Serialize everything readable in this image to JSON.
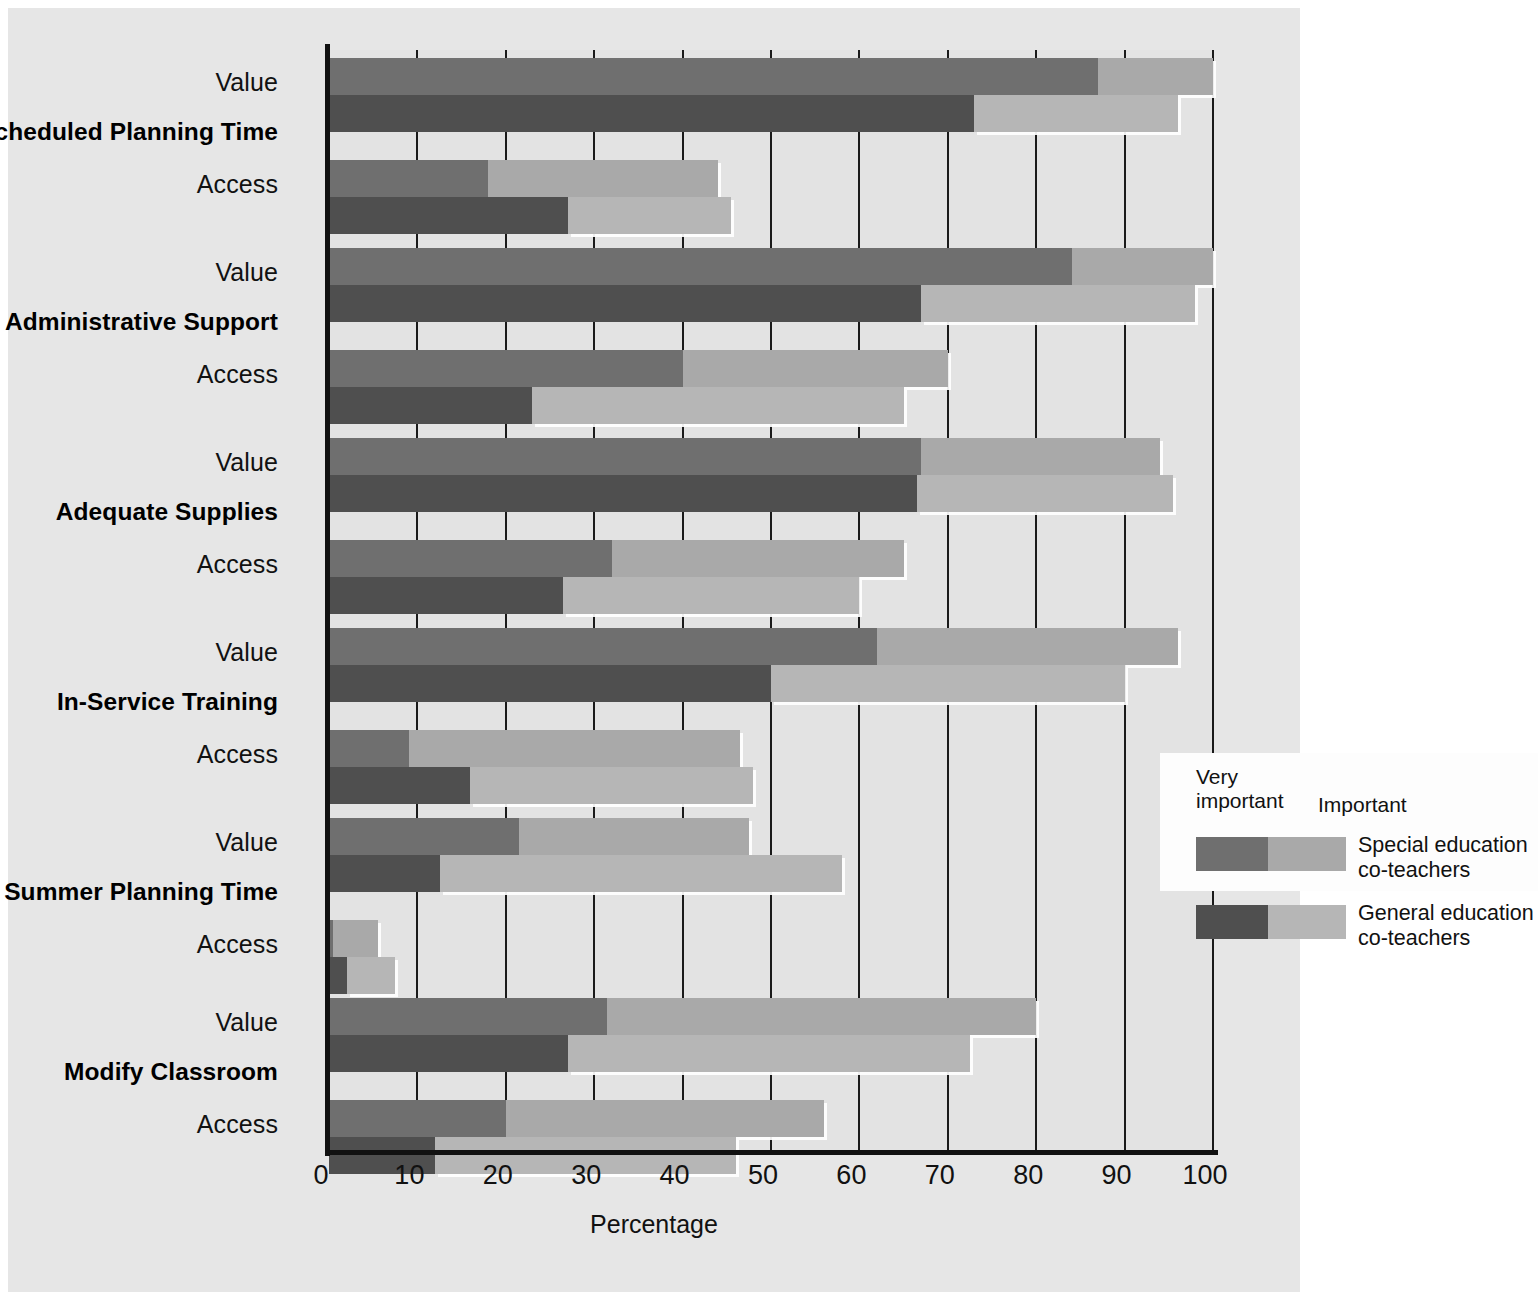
{
  "chart_data": {
    "type": "bar",
    "orientation": "horizontal",
    "stacked": true,
    "title": "",
    "xlabel": "Percentage",
    "ylabel": "",
    "xlim": [
      0,
      100
    ],
    "xticks": [
      0,
      10,
      20,
      30,
      40,
      50,
      60,
      70,
      80,
      90,
      100
    ],
    "grid": true,
    "legend_position": "center-right",
    "legend": {
      "header_very_important": "Very\nimportant",
      "header_very_important_line1": "Very",
      "header_very_important_line2": "important",
      "header_important": "Important",
      "entries": [
        {
          "name": "Special education co-teachers",
          "line1": "Special education",
          "line2": "co-teachers",
          "very_important_color": "#6f6f6f",
          "important_color": "#a9a9a9"
        },
        {
          "name": "General education co-teachers",
          "line1": "General education",
          "line2": "co-teachers",
          "very_important_color": "#4f4f4f",
          "important_color": "#b6b6b6"
        }
      ]
    },
    "segment_names": [
      "Very important",
      "Important"
    ],
    "series_names": [
      "Special education co-teachers",
      "General education co-teachers"
    ],
    "row_measures": [
      "Value",
      "Access"
    ],
    "categories": [
      "Scheduled Planning Time",
      "Administrative Support",
      "Adequate Supplies",
      "In-Service Training",
      "Summer Planning Time",
      "Modify Classroom"
    ],
    "groups": [
      {
        "category": "Scheduled Planning Time",
        "rows": [
          {
            "measure": "Value",
            "bars": [
              {
                "series": "Special education co-teachers",
                "very_important": 87,
                "important": 13,
                "total": 100
              },
              {
                "series": "General education co-teachers",
                "very_important": 73,
                "important": 23,
                "total": 96
              }
            ]
          },
          {
            "measure": "Access",
            "bars": [
              {
                "series": "Special education co-teachers",
                "very_important": 18,
                "important": 26,
                "total": 44
              },
              {
                "series": "General education co-teachers",
                "very_important": 27,
                "important": 18.5,
                "total": 45.5
              }
            ]
          }
        ]
      },
      {
        "category": "Administrative Support",
        "rows": [
          {
            "measure": "Value",
            "bars": [
              {
                "series": "Special education co-teachers",
                "very_important": 84,
                "important": 16,
                "total": 100
              },
              {
                "series": "General education co-teachers",
                "very_important": 67,
                "important": 31,
                "total": 98
              }
            ]
          },
          {
            "measure": "Access",
            "bars": [
              {
                "series": "Special education co-teachers",
                "very_important": 40,
                "important": 30,
                "total": 70
              },
              {
                "series": "General education co-teachers",
                "very_important": 23,
                "important": 42,
                "total": 65
              }
            ]
          }
        ]
      },
      {
        "category": "Adequate Supplies",
        "rows": [
          {
            "measure": "Value",
            "bars": [
              {
                "series": "Special education co-teachers",
                "very_important": 67,
                "important": 27,
                "total": 94
              },
              {
                "series": "General education co-teachers",
                "very_important": 66.5,
                "important": 29,
                "total": 95.5
              }
            ]
          },
          {
            "measure": "Access",
            "bars": [
              {
                "series": "Special education co-teachers",
                "very_important": 32,
                "important": 33,
                "total": 65
              },
              {
                "series": "General education co-teachers",
                "very_important": 26.5,
                "important": 33.5,
                "total": 60
              }
            ]
          }
        ]
      },
      {
        "category": "In-Service Training",
        "rows": [
          {
            "measure": "Value",
            "bars": [
              {
                "series": "Special education co-teachers",
                "very_important": 62,
                "important": 34,
                "total": 96
              },
              {
                "series": "General education co-teachers",
                "very_important": 50,
                "important": 40,
                "total": 90
              }
            ]
          },
          {
            "measure": "Access",
            "bars": [
              {
                "series": "Special education co-teachers",
                "very_important": 9,
                "important": 37.5,
                "total": 46.5
              },
              {
                "series": "General education co-teachers",
                "very_important": 16,
                "important": 32,
                "total": 48
              }
            ]
          }
        ]
      },
      {
        "category": "Summer Planning Time",
        "rows": [
          {
            "measure": "Value",
            "bars": [
              {
                "series": "Special education co-teachers",
                "very_important": 21.5,
                "important": 26,
                "total": 47.5
              },
              {
                "series": "General education co-teachers",
                "very_important": 12.5,
                "important": 45.5,
                "total": 58
              }
            ]
          },
          {
            "measure": "Access",
            "bars": [
              {
                "series": "Special education co-teachers",
                "very_important": 0.5,
                "important": 5,
                "total": 5.5
              },
              {
                "series": "General education co-teachers",
                "very_important": 2,
                "important": 5.5,
                "total": 7.5
              }
            ]
          }
        ]
      },
      {
        "category": "Modify Classroom",
        "rows": [
          {
            "measure": "Value",
            "bars": [
              {
                "series": "Special education co-teachers",
                "very_important": 31.5,
                "important": 48.5,
                "total": 80
              },
              {
                "series": "General education co-teachers",
                "very_important": 27,
                "important": 45.5,
                "total": 72.5
              }
            ]
          },
          {
            "measure": "Access",
            "bars": [
              {
                "series": "Special education co-teachers",
                "very_important": 20,
                "important": 36,
                "total": 56
              },
              {
                "series": "General education co-teachers",
                "very_important": 12,
                "important": 34,
                "total": 46
              }
            ]
          }
        ]
      }
    ]
  },
  "colors": {
    "special_very_important": "#6f6f6f",
    "special_important": "#a9a9a9",
    "general_very_important": "#4f4f4f",
    "general_important": "#b6b6b6",
    "plot_background": "#e3e3e3",
    "page_background": "#e6e6e6",
    "axis": "#111111"
  }
}
